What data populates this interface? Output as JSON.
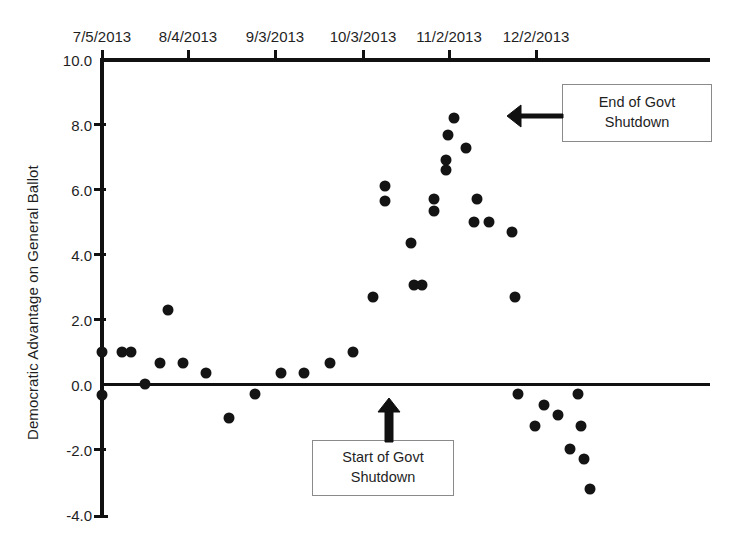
{
  "chart_data": {
    "type": "scatter",
    "title": "",
    "xlabel": "",
    "ylabel": "Democratic Advantage on General Ballot",
    "xlim": [
      "2013-07-05",
      "2013-12-25"
    ],
    "ylim": [
      -4.0,
      10.0
    ],
    "grid": false,
    "legend": "none",
    "x_axis_position": "top",
    "xtick_labels": [
      "7/5/2013",
      "8/4/2013",
      "9/3/2013",
      "10/3/2013",
      "11/2/2013",
      "12/2/2013"
    ],
    "ytick_labels": [
      "10.0",
      "8.0",
      "6.0",
      "4.0",
      "2.0",
      "0.0",
      "-2.0",
      "-4.0"
    ],
    "ytick_values": [
      10.0,
      8.0,
      6.0,
      4.0,
      2.0,
      0.0,
      -2.0,
      -4.0
    ],
    "zero_line": 0.0,
    "marker": "filled-circle",
    "marker_color": "#141414",
    "points": [
      {
        "x": "7/5/2013",
        "y": 1.0
      },
      {
        "x": "7/5/2013",
        "y": -0.35
      },
      {
        "x": "7/12/2013",
        "y": 1.0
      },
      {
        "x": "7/15/2013",
        "y": 1.0
      },
      {
        "x": "7/20/2013",
        "y": 0.0
      },
      {
        "x": "7/28/2013",
        "y": 2.3
      },
      {
        "x": "7/25/2013",
        "y": 0.65
      },
      {
        "x": "8/2/2013",
        "y": 0.65
      },
      {
        "x": "8/10/2013",
        "y": 0.35
      },
      {
        "x": "8/18/2013",
        "y": -1.05
      },
      {
        "x": "8/27/2013",
        "y": -0.3
      },
      {
        "x": "9/5/2013",
        "y": 0.35
      },
      {
        "x": "9/13/2013",
        "y": 0.35
      },
      {
        "x": "9/22/2013",
        "y": 0.65
      },
      {
        "x": "9/30/2013",
        "y": 1.0
      },
      {
        "x": "10/7/2013",
        "y": 2.7
      },
      {
        "x": "10/11/2013",
        "y": 6.1
      },
      {
        "x": "10/11/2013",
        "y": 5.65
      },
      {
        "x": "10/20/2013",
        "y": 4.35
      },
      {
        "x": "10/21/2013",
        "y": 3.05
      },
      {
        "x": "10/24/2013",
        "y": 3.05
      },
      {
        "x": "10/28/2013",
        "y": 5.7
      },
      {
        "x": "10/28/2013",
        "y": 5.35
      },
      {
        "x": "11/1/2013",
        "y": 6.6
      },
      {
        "x": "11/1/2013",
        "y": 6.9
      },
      {
        "x": "11/2/2013",
        "y": 7.7
      },
      {
        "x": "11/4/2013",
        "y": 8.2
      },
      {
        "x": "11/8/2013",
        "y": 7.3
      },
      {
        "x": "11/12/2013",
        "y": 5.7
      },
      {
        "x": "11/11/2013",
        "y": 5.0
      },
      {
        "x": "11/16/2013",
        "y": 5.0
      },
      {
        "x": "11/24/2013",
        "y": 4.7
      },
      {
        "x": "11/25/2013",
        "y": 2.7
      },
      {
        "x": "11/26/2013",
        "y": -0.3
      },
      {
        "x": "12/2/2013",
        "y": -1.3
      },
      {
        "x": "12/5/2013",
        "y": -0.65
      },
      {
        "x": "12/10/2013",
        "y": -0.95
      },
      {
        "x": "12/17/2013",
        "y": -0.3
      },
      {
        "x": "12/14/2013",
        "y": -2.0
      },
      {
        "x": "12/18/2013",
        "y": -1.3
      },
      {
        "x": "12/19/2013",
        "y": -2.3
      },
      {
        "x": "12/21/2013",
        "y": -3.25
      }
    ],
    "annotations": [
      {
        "id": "end-shutdown",
        "text_line1": "End of Govt",
        "text_line2": "Shutdown",
        "arrow": "left"
      },
      {
        "id": "start-shutdown",
        "text_line1": "Start of Govt",
        "text_line2": "Shutdown",
        "arrow": "up"
      }
    ]
  },
  "colors": {
    "axis": "#111111",
    "marker": "#141414",
    "box_border": "#8a8a8a",
    "text": "#1f1f1f",
    "background": "#ffffff"
  }
}
